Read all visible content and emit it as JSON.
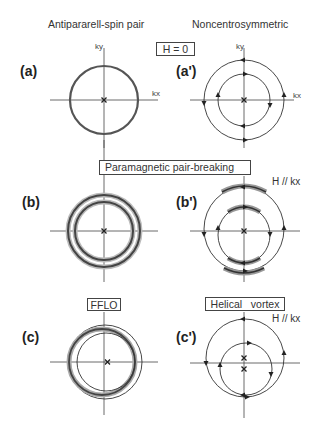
{
  "columns": {
    "left_title": "Antipararell-spin pair",
    "right_title": "Noncentrosymmetric"
  },
  "boxes": {
    "h_zero": "H = 0",
    "paramagnetic": "Paramagnetic pair-breaking",
    "fflo": "FFLO",
    "helical": "Helical   vortex"
  },
  "field_labels": {
    "b_prime": "H // kx",
    "c_prime": "H // kx"
  },
  "axis_labels": {
    "ky": "ky",
    "kx": "kx"
  },
  "panels": [
    {
      "id": "a",
      "label": "(a)",
      "description": "single Fermi circle, Cooper pair center at origin"
    },
    {
      "id": "a_prime",
      "label": "(a')",
      "description": "two spin-split Fermi circles with opposite helicity arrows"
    },
    {
      "id": "b",
      "label": "(b)",
      "description": "Zeeman-split broadened double ring"
    },
    {
      "id": "b_prime",
      "label": "(b')",
      "description": "distorted helical Fermi surfaces under H // kx"
    },
    {
      "id": "c",
      "label": "(c)",
      "description": "FFLO: shifted inner ring, finite-momentum pairing"
    },
    {
      "id": "c_prime",
      "label": "(c')",
      "description": "helical vortex: circles shifted along ky, two pair centers"
    }
  ],
  "colors": {
    "line": "#3a3a3a",
    "ring": "#555555",
    "box_border": "#444444"
  }
}
